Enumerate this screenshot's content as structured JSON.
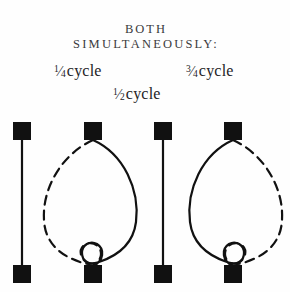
{
  "page": {
    "background_color": "#fefefe",
    "ink_color": "#111111",
    "heading_color": "#3a3a3c",
    "width": 290,
    "height": 292
  },
  "heading": {
    "line1": "BOTH",
    "line2": "SIMULTANEOUSLY:"
  },
  "labels": {
    "quarter": {
      "numerator": "1",
      "slash": "⁄",
      "denominator": "4",
      "word": "cycle"
    },
    "half": {
      "numerator": "1",
      "slash": "⁄",
      "denominator": "2",
      "word": "cycle"
    },
    "three_quarter": {
      "numerator": "3",
      "slash": "⁄",
      "denominator": "4",
      "word": "cycle"
    }
  },
  "diagram": {
    "type": "standing-wave-cycle-figures",
    "figure_count": 4,
    "node_square": {
      "size": 18,
      "color": "#111111",
      "shape": "filled-square"
    },
    "top_node_y": 12,
    "bottom_node_y": 155,
    "stroke_width": 2.2,
    "dash_pattern": "9 6",
    "figures": [
      {
        "index": 1,
        "name": "straight-line-figure-left",
        "center_x": 22,
        "strands": [
          {
            "style": "solid",
            "bulge": "none",
            "path": "M 22 30 L 22 156"
          }
        ]
      },
      {
        "index": 2,
        "name": "crossed-lens-figure-dashed-left",
        "center_x": 93,
        "strands": [
          {
            "style": "dashed",
            "bulge": "left",
            "path": "M 93 30 C 62 44 42 78 44 110 C 45 134 62 146 80 152 C 93 157 101 152 101 144 C 101 136 93 131 86 134 C 78 138 78 150 93 156"
          },
          {
            "style": "solid",
            "bulge": "right",
            "path": "M 93 30 C 124 44 140 80 136 112 C 133 136 114 147 99 152 C 88 156 82 150 82 143 C 82 135 90 130 97 134 C 105 139 104 151 93 156"
          }
        ]
      },
      {
        "index": 3,
        "name": "straight-line-figure-right",
        "center_x": 163,
        "strands": [
          {
            "style": "solid",
            "bulge": "none",
            "path": "M 163 30 L 163 156"
          }
        ]
      },
      {
        "index": 4,
        "name": "crossed-lens-figure-dashed-right",
        "center_x": 233,
        "strands": [
          {
            "style": "solid",
            "bulge": "left",
            "path": "M 233 30 C 202 44 186 80 190 112 C 193 136 212 147 227 152 C 238 156 244 150 244 143 C 244 135 236 130 229 134 C 221 139 222 151 233 156"
          },
          {
            "style": "dashed",
            "bulge": "right",
            "path": "M 233 30 C 264 44 284 78 282 110 C 281 134 264 146 246 152 C 233 157 225 152 225 144 C 225 136 233 131 240 134 C 248 138 248 150 233 156"
          }
        ]
      }
    ]
  }
}
